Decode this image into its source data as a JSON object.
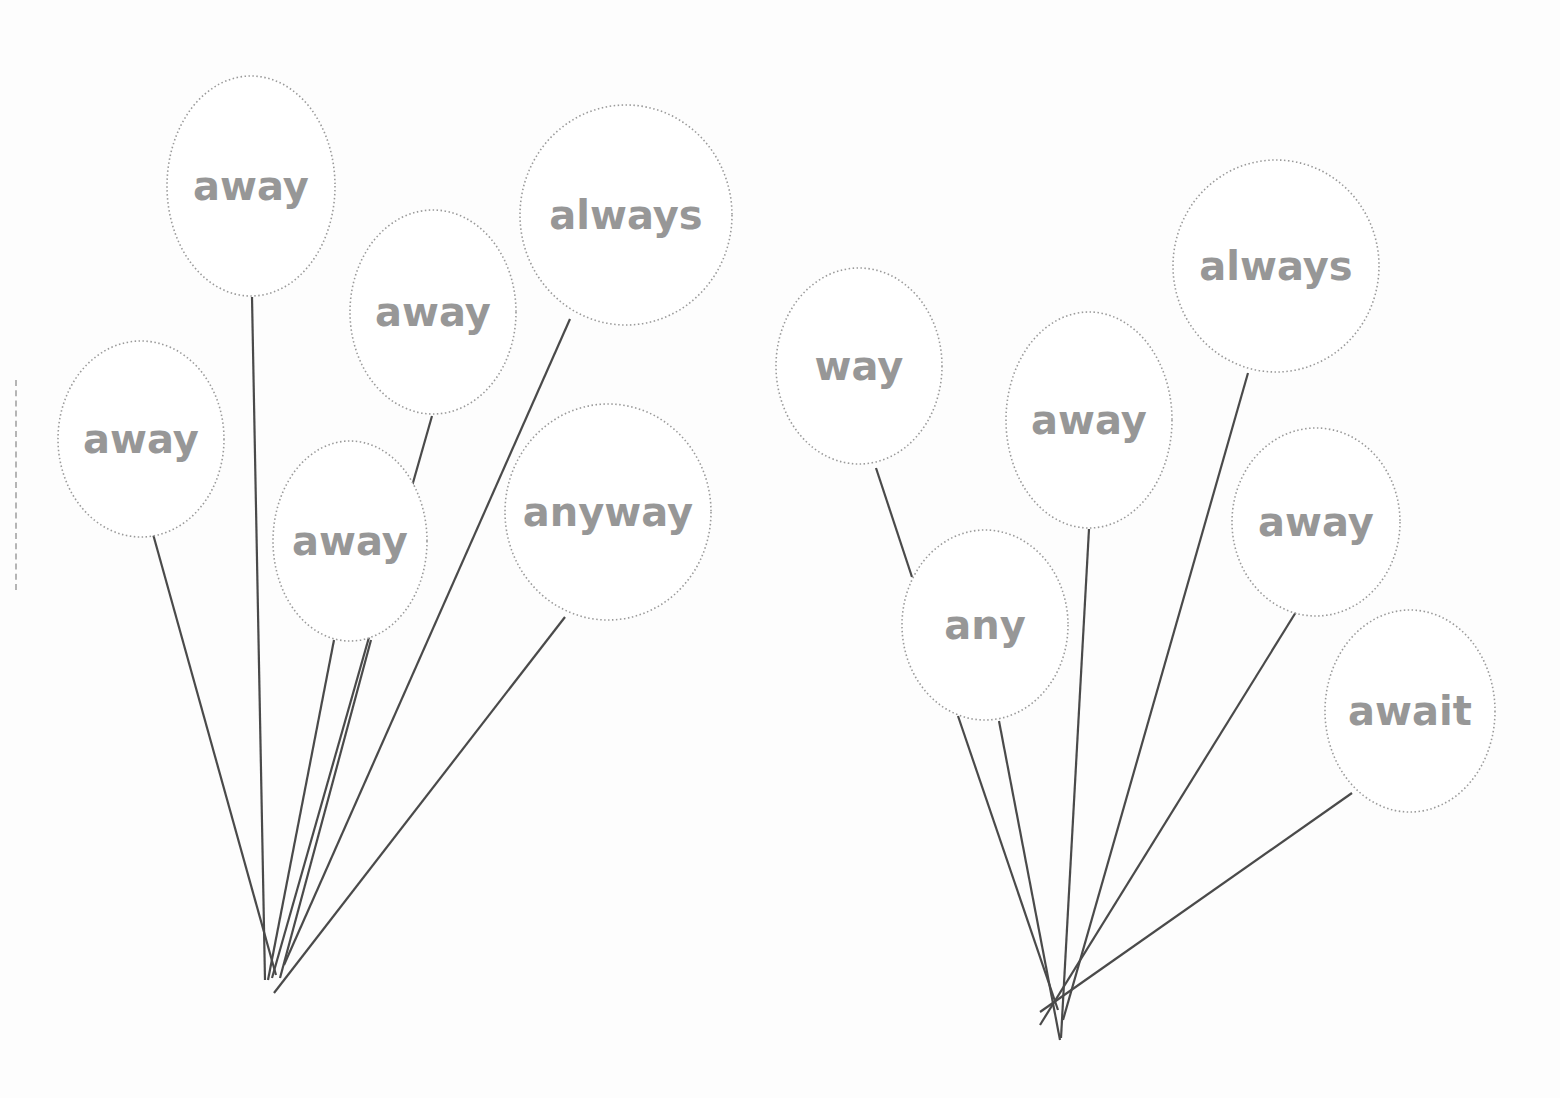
{
  "worksheet": {
    "groups": [
      {
        "name": "left-bunch",
        "balloons": [
          {
            "word": "away",
            "cx": 251,
            "cy": 186,
            "rx": 84,
            "ry": 110,
            "font": 40,
            "tie": [
              252,
              297
            ],
            "knot": [
              265,
              980
            ]
          },
          {
            "word": "away",
            "cx": 141,
            "cy": 439,
            "rx": 83,
            "ry": 98,
            "font": 40,
            "tie": [
              153,
              534
            ],
            "knot": [
              276,
              975
            ]
          },
          {
            "word": "away",
            "cx": 433,
            "cy": 312,
            "rx": 83,
            "ry": 102,
            "font": 40,
            "tie": [
              432,
              416
            ],
            "knot": [
              272,
              978
            ]
          },
          {
            "word": "away",
            "cx": 350,
            "cy": 541,
            "rx": 77,
            "ry": 100,
            "font": 40,
            "tie": [
              334,
              640
            ],
            "knot": [
              268,
              980
            ]
          },
          {
            "word": "",
            "cx": 0,
            "cy": 0,
            "rx": 0,
            "ry": 0,
            "font": 0,
            "tie": [
              371,
              640
            ],
            "knot": [
              280,
              978
            ]
          },
          {
            "word": "always",
            "cx": 626,
            "cy": 215,
            "rx": 106,
            "ry": 110,
            "font": 40,
            "tie": [
              570,
              319
            ],
            "knot": [
              284,
              965
            ]
          },
          {
            "word": "anyway",
            "cx": 608,
            "cy": 512,
            "rx": 103,
            "ry": 108,
            "font": 40,
            "tie": [
              565,
              617
            ],
            "knot": [
              274,
              993
            ]
          }
        ]
      },
      {
        "name": "right-bunch",
        "balloons": [
          {
            "word": "way",
            "cx": 859,
            "cy": 366,
            "rx": 83,
            "ry": 98,
            "font": 40,
            "tie": [
              876,
              468
            ],
            "knot": [
              912,
              577
            ]
          },
          {
            "word": "any",
            "cx": 985,
            "cy": 625,
            "rx": 83,
            "ry": 95,
            "font": 40,
            "tie": [
              958,
              716
            ],
            "knot": [
              1058,
              1010
            ]
          },
          {
            "word": "",
            "cx": 0,
            "cy": 0,
            "rx": 0,
            "ry": 0,
            "font": 0,
            "tie": [
              999,
              721
            ],
            "knot": [
              1060,
              1040
            ]
          },
          {
            "word": "away",
            "cx": 1089,
            "cy": 420,
            "rx": 83,
            "ry": 108,
            "font": 40,
            "tie": [
              1089,
              529
            ],
            "knot": [
              1061,
              1038
            ]
          },
          {
            "word": "always",
            "cx": 1276,
            "cy": 266,
            "rx": 103,
            "ry": 106,
            "font": 40,
            "tie": [
              1248,
              373
            ],
            "knot": [
              1063,
              1020
            ]
          },
          {
            "word": "away",
            "cx": 1316,
            "cy": 522,
            "rx": 84,
            "ry": 94,
            "font": 40,
            "tie": [
              1296,
              612
            ],
            "knot": [
              1040,
              1025
            ]
          },
          {
            "word": "await",
            "cx": 1410,
            "cy": 711,
            "rx": 85,
            "ry": 101,
            "font": 40,
            "tie": [
              1352,
              793
            ],
            "knot": [
              1040,
              1012
            ]
          }
        ]
      }
    ],
    "colors": {
      "word": "#979797",
      "outline": "#9a9a9a",
      "string": "#4a4a4a"
    }
  }
}
